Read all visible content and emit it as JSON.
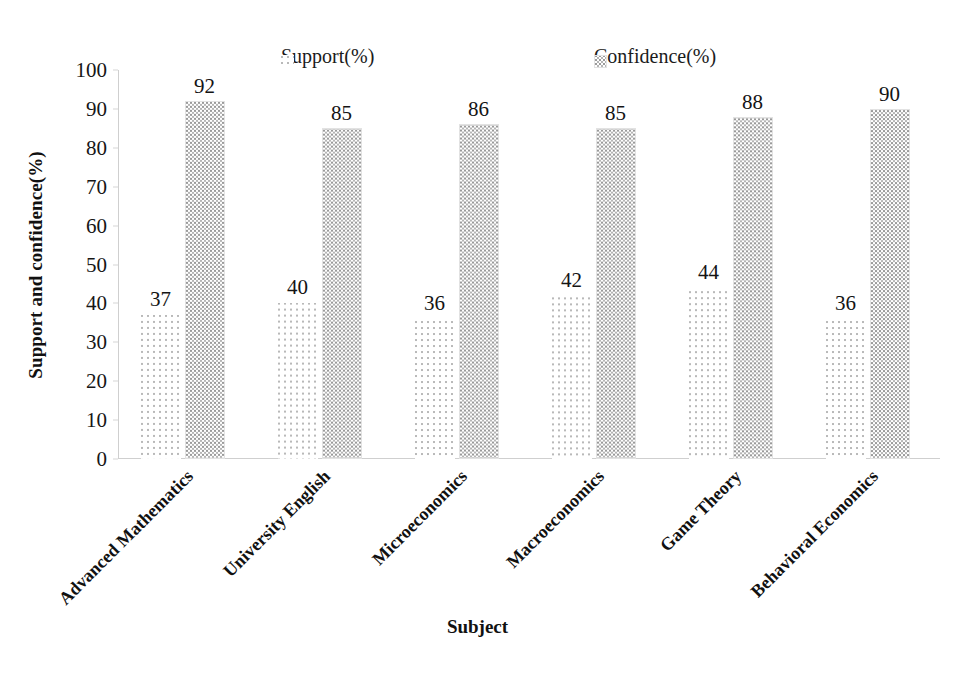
{
  "chart_data": {
    "type": "bar",
    "title": "",
    "xlabel": "Subject",
    "ylabel": "Support and confidence(%)",
    "ylim": [
      0,
      100
    ],
    "ytick_step": 10,
    "yticks": [
      "100",
      "90",
      "80",
      "70",
      "60",
      "50",
      "40",
      "30",
      "20",
      "10",
      "0"
    ],
    "grid": false,
    "legend_position": "top",
    "categories": [
      "Advanced Mathematics",
      "University English",
      "Microeconomics",
      "Macroeconomics",
      "Game Theory",
      "Behavioral Economics"
    ],
    "series": [
      {
        "name": "Support(%)",
        "pattern": "sparse-dots",
        "values": [
          37,
          40,
          36,
          42,
          44,
          36
        ]
      },
      {
        "name": "Confidence(%)",
        "pattern": "dense-dots",
        "values": [
          92,
          85,
          86,
          85,
          88,
          90
        ]
      }
    ]
  },
  "legend": {
    "entries": [
      {
        "label": "Support(%)",
        "swatch": "sparse-dots-swatch"
      },
      {
        "label": "Confidence(%)",
        "swatch": "dense-dots-swatch"
      }
    ]
  },
  "axes": {
    "y_title": "Support and confidence(%)",
    "x_title": "Subject"
  },
  "colors": {
    "background": "#ffffff",
    "text": "#111111",
    "support_dots": "#b9b9b9",
    "confidence_dots": "#9a9a9a",
    "axis": "#cfcfcf"
  }
}
